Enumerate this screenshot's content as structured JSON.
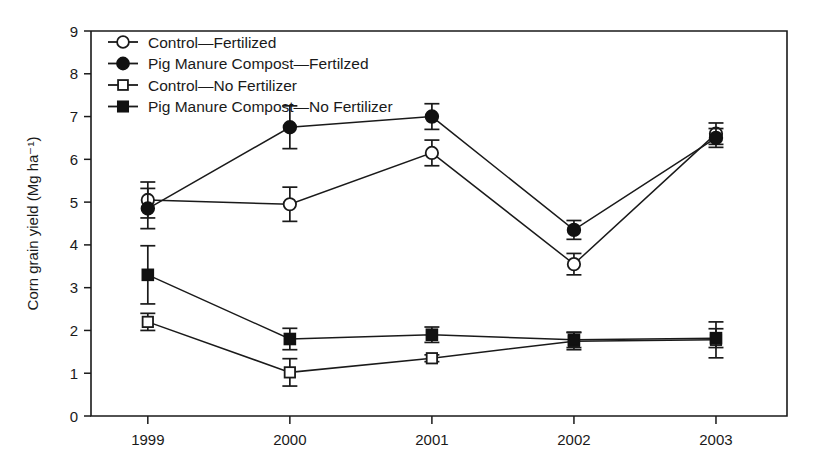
{
  "chart_data": {
    "type": "line",
    "title": "",
    "subtitle": "",
    "xlabel": "",
    "ylabel": "Corn grain yield (Mg ha⁻¹)",
    "categories": [
      "1999",
      "2000",
      "2001",
      "2002",
      "2003"
    ],
    "x": [
      1999,
      2000,
      2001,
      2002,
      2003
    ],
    "xlim": [
      1998.6,
      2003.5
    ],
    "ylim": [
      0,
      9
    ],
    "yticks": [
      0,
      1,
      2,
      3,
      4,
      5,
      6,
      7,
      8,
      9
    ],
    "ytick_labels": [
      "0",
      "1",
      "2",
      "3",
      "4",
      "5",
      "6",
      "7",
      "8",
      "9"
    ],
    "xtick_labels": [
      "1999",
      "2000",
      "2001",
      "2002",
      "2003"
    ],
    "grid": false,
    "legend_position": "top-left",
    "error_bars": "symmetric vertical whiskers with caps",
    "series": [
      {
        "name": "Control—Fertilized",
        "marker": "open-circle",
        "values": [
          5.05,
          4.95,
          6.15,
          3.55,
          6.6
        ],
        "errors": [
          0.42,
          0.4,
          0.3,
          0.25,
          0.25
        ]
      },
      {
        "name": "Pig Manure Compost—Fertilzed",
        "marker": "filled-circle",
        "values": [
          4.85,
          6.75,
          7.0,
          4.35,
          6.5
        ],
        "errors": [
          0.47,
          0.5,
          0.3,
          0.22,
          0.22
        ]
      },
      {
        "name": "Control—No Fertilizer",
        "marker": "open-square",
        "values": [
          2.2,
          1.02,
          1.35,
          1.75,
          1.78
        ],
        "errors": [
          0.2,
          0.32,
          0.08,
          0.2,
          0.42
        ]
      },
      {
        "name": "Pig Manure Compost—No Fertilizer",
        "marker": "filled-square",
        "values": [
          3.3,
          1.8,
          1.9,
          1.78,
          1.82
        ],
        "errors": [
          0.68,
          0.25,
          0.18,
          0.18,
          0.22
        ]
      }
    ]
  },
  "legend": {
    "items": [
      {
        "label": "Control—Fertilized",
        "marker": "open-circle"
      },
      {
        "label": "Pig Manure Compost—Fertilzed",
        "marker": "filled-circle"
      },
      {
        "label": "Control—No Fertilizer",
        "marker": "open-square"
      },
      {
        "label": "Pig Manure Compost—No Fertilizer",
        "marker": "filled-square"
      }
    ]
  },
  "colors": {
    "foreground": "#1a1a1a",
    "background": "#ffffff",
    "marker_fill_open": "#ffffff",
    "marker_fill_closed": "#111111"
  }
}
